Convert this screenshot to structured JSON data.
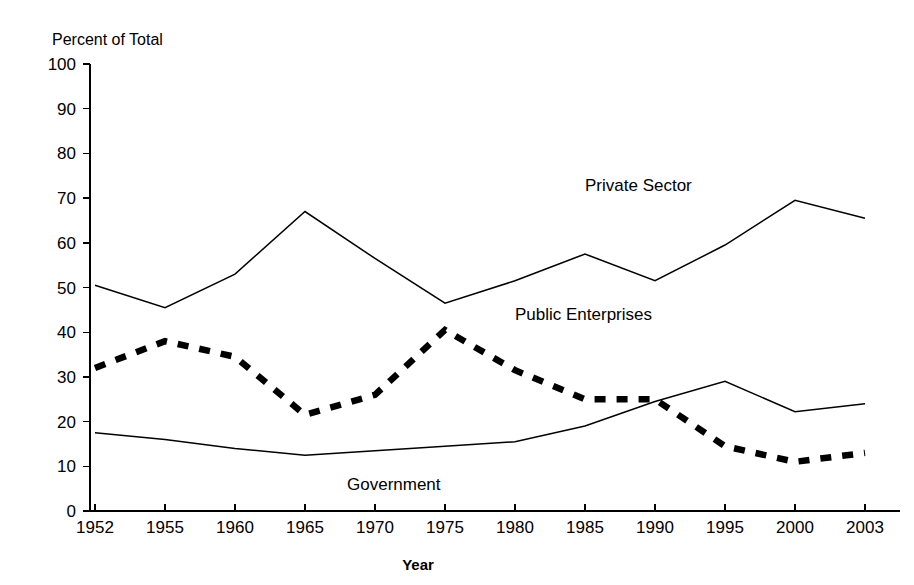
{
  "chart_data": {
    "type": "line",
    "title": "",
    "caption": "Percent of Total",
    "xlabel": "Year",
    "ylabel": "",
    "categories": [
      "1952",
      "1955",
      "1960",
      "1965",
      "1970",
      "1975",
      "1980",
      "1985",
      "1990",
      "1995",
      "2000",
      "2003"
    ],
    "ylim": [
      0,
      100
    ],
    "yticks": [
      "0",
      "10",
      "20",
      "30",
      "40",
      "50",
      "60",
      "70",
      "80",
      "90",
      "100"
    ],
    "grid": false,
    "legend_position": "inline-annotations",
    "series": [
      {
        "name": "Private Sector",
        "style": "thin-solid",
        "color": "#000000",
        "values": [
          50.5,
          45.5,
          53,
          67,
          56.5,
          46.5,
          51.5,
          57.5,
          51.5,
          59.5,
          69.5,
          65.5
        ],
        "label_x": "1985",
        "label_y": 73
      },
      {
        "name": "Public Enterprises",
        "style": "thick-dashed",
        "color": "#000000",
        "values": [
          32,
          38,
          34.5,
          21.5,
          26,
          40.5,
          31.5,
          25,
          25,
          14.5,
          11,
          13
        ],
        "label_x": "1980",
        "label_y": 44
      },
      {
        "name": "Government",
        "style": "thin-solid",
        "color": "#000000",
        "values": [
          17.5,
          16,
          14,
          12.5,
          13.5,
          14.5,
          15.5,
          19,
          24.5,
          29,
          22.2,
          24
        ],
        "label_x": "1968",
        "label_y": 6
      }
    ]
  }
}
